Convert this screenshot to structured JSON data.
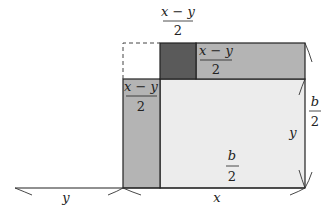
{
  "diagram": {
    "title": "",
    "colors": {
      "dark_square": "#5a5a5a",
      "strip": "#b4b4b4",
      "large_square": "#ececec",
      "outline": "#222222",
      "background": "#ffffff"
    },
    "labels": {
      "top_fraction": {
        "numerator": "x − y",
        "denominator": "2"
      },
      "top_strip_fraction": {
        "numerator": "x − y",
        "denominator": "2"
      },
      "left_strip_fraction": {
        "numerator": "x − y",
        "denominator": "2"
      },
      "center_fraction": {
        "numerator": "b",
        "denominator": "2"
      },
      "right_fraction": {
        "numerator": "b",
        "denominator": "2"
      },
      "right_inner_y": "y",
      "bottom_left_y": "y",
      "bottom_right_x": "x"
    },
    "shapes": [
      {
        "name": "missing-corner-square",
        "style": "dashed",
        "fill": "none"
      },
      {
        "name": "dark-square",
        "fill": "dark"
      },
      {
        "name": "top-strip",
        "fill": "medium"
      },
      {
        "name": "left-strip",
        "fill": "medium"
      },
      {
        "name": "large-square",
        "fill": "light"
      }
    ]
  }
}
